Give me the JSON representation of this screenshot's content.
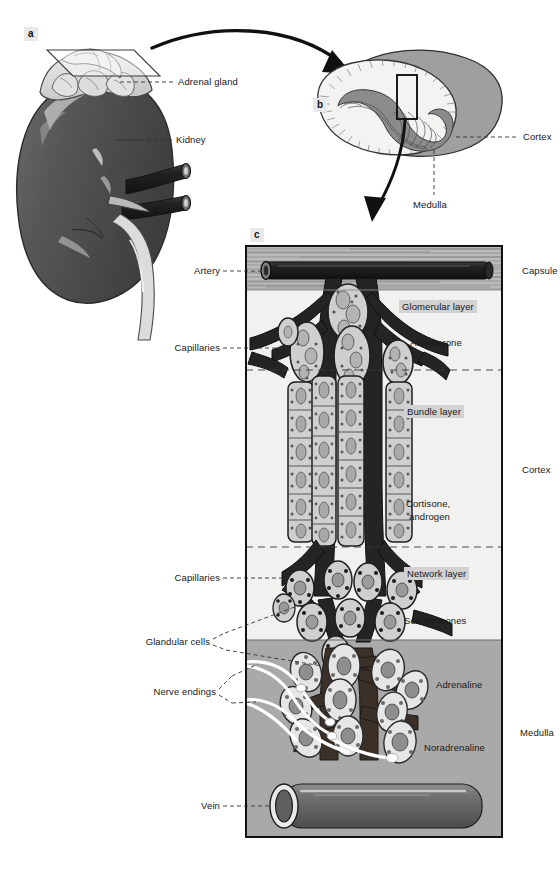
{
  "figure": {
    "panels": [
      {
        "letter": "a",
        "caption": "Kidney with adrenal gland and cutting plane"
      },
      {
        "letter": "b",
        "caption": "Sectioned adrenal gland showing cortex and medulla"
      },
      {
        "letter": "c",
        "caption": "Histological detail of adrenal cortex and medulla"
      }
    ]
  },
  "panel_a": {
    "letter": "a",
    "labels": [
      {
        "name": "adrenal-gland",
        "text": "Adrenal gland"
      },
      {
        "name": "kidney",
        "text": "Kidney"
      }
    ]
  },
  "panel_b": {
    "letter": "b",
    "labels": [
      {
        "name": "cortex",
        "text": "Cortex"
      },
      {
        "name": "medulla",
        "text": "Medulla"
      }
    ]
  },
  "panel_c": {
    "letter": "c",
    "left_labels": [
      {
        "name": "artery",
        "text": "Artery"
      },
      {
        "name": "capillaries-upper",
        "text": "Capillaries"
      },
      {
        "name": "capillaries-lower",
        "text": "Capillaries"
      },
      {
        "name": "glandular-cells",
        "text": "Glandular cells"
      },
      {
        "name": "nerve-endings",
        "text": "Nerve endings"
      },
      {
        "name": "vein",
        "text": "Vein"
      }
    ],
    "right_labels": [
      {
        "name": "capsule",
        "text": "Capsule"
      },
      {
        "name": "cortex",
        "text": "Cortex"
      },
      {
        "name": "medulla",
        "text": "Medulla"
      }
    ],
    "zones": [
      {
        "name": "glomerular-layer",
        "layer": "Glomerular layer",
        "hormone": "Aldosterone"
      },
      {
        "name": "bundle-layer",
        "layer": "Bundle layer",
        "hormone": "Cortisone, androgen"
      },
      {
        "name": "network-layer",
        "layer": "Network layer",
        "hormone": "Sex hormones"
      },
      {
        "name": "medulla-zone",
        "layer": "Adrenaline",
        "hormone": "Noradrenaline"
      }
    ],
    "hormone_cortisone_line1": "Cortisone,",
    "hormone_cortisone_line2": "androgen"
  },
  "colors": {
    "capsule": "#b9b9b9",
    "cortex": "#f1f1ef",
    "medulla": "#a9a9a9",
    "vessel_dark": "#2b2b2b",
    "vessel_mid": "#5a5a5a",
    "cell_fill": "#cfcfcf",
    "kidney": "#555555",
    "gland": "#d8d8d8",
    "label_text": "#181818",
    "highlight_bg": "#d2d2d2"
  }
}
